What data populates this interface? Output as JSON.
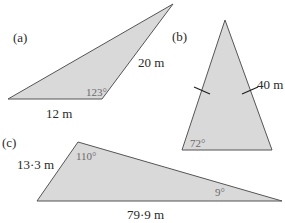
{
  "figures": [
    {
      "id": "a",
      "label": "(a)",
      "side_labels": [
        "20 m",
        "12 m"
      ],
      "angle_label": "123°"
    },
    {
      "id": "b",
      "label": "(b)",
      "side_labels": [
        "40 m"
      ],
      "angle_label": "72°"
    },
    {
      "id": "c",
      "label": "(c)",
      "side_labels": [
        "13·3 m",
        "79·9 m"
      ],
      "angle_labels": [
        "110°",
        "9°"
      ]
    }
  ],
  "colors": {
    "fill": "#d9d9d9",
    "stroke": "#555555"
  }
}
